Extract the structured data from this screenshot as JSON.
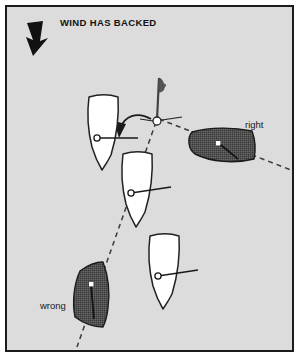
{
  "figure": {
    "title": "WIND HAS BACKED",
    "background_color": "#dcdcdc",
    "frame_color": "#1b1b1b",
    "page_color": "#ffffff",
    "width": 299,
    "height": 357
  },
  "wind": {
    "arrow_name": "wind-direction-arrow",
    "direction": "down",
    "color": "#111111"
  },
  "mark": {
    "name": "racing-mark-buoy",
    "flag_color": "#555555",
    "pole_color": "#444444",
    "buoy_fill": "#ffffff",
    "buoy_stroke": "#222222"
  },
  "turn_arrow": {
    "name": "tack-turn-arrow",
    "color": "#1a1a1a"
  },
  "laylines": {
    "color": "#3a3a3a",
    "style": "dashed",
    "dash": "5 4"
  },
  "boats": [
    {
      "id": "boat-white-upper",
      "label": "",
      "fill": "#ffffff",
      "stroke": "#222222",
      "heading": "up",
      "shaded": false
    },
    {
      "id": "boat-white-middle",
      "label": "",
      "fill": "#ffffff",
      "stroke": "#222222",
      "heading": "up",
      "shaded": false
    },
    {
      "id": "boat-white-lower",
      "label": "",
      "fill": "#ffffff",
      "stroke": "#222222",
      "heading": "up",
      "shaded": false
    },
    {
      "id": "boat-shaded-right",
      "label": "right",
      "fill": "#4e4e4e",
      "stroke": "#1a1a1a",
      "heading": "left",
      "shaded": true
    },
    {
      "id": "boat-shaded-wrong",
      "label": "wrong",
      "fill": "#4e4e4e",
      "stroke": "#1a1a1a",
      "heading": "up",
      "shaded": true
    }
  ],
  "labels": {
    "right": "right",
    "wrong": "wrong"
  }
}
